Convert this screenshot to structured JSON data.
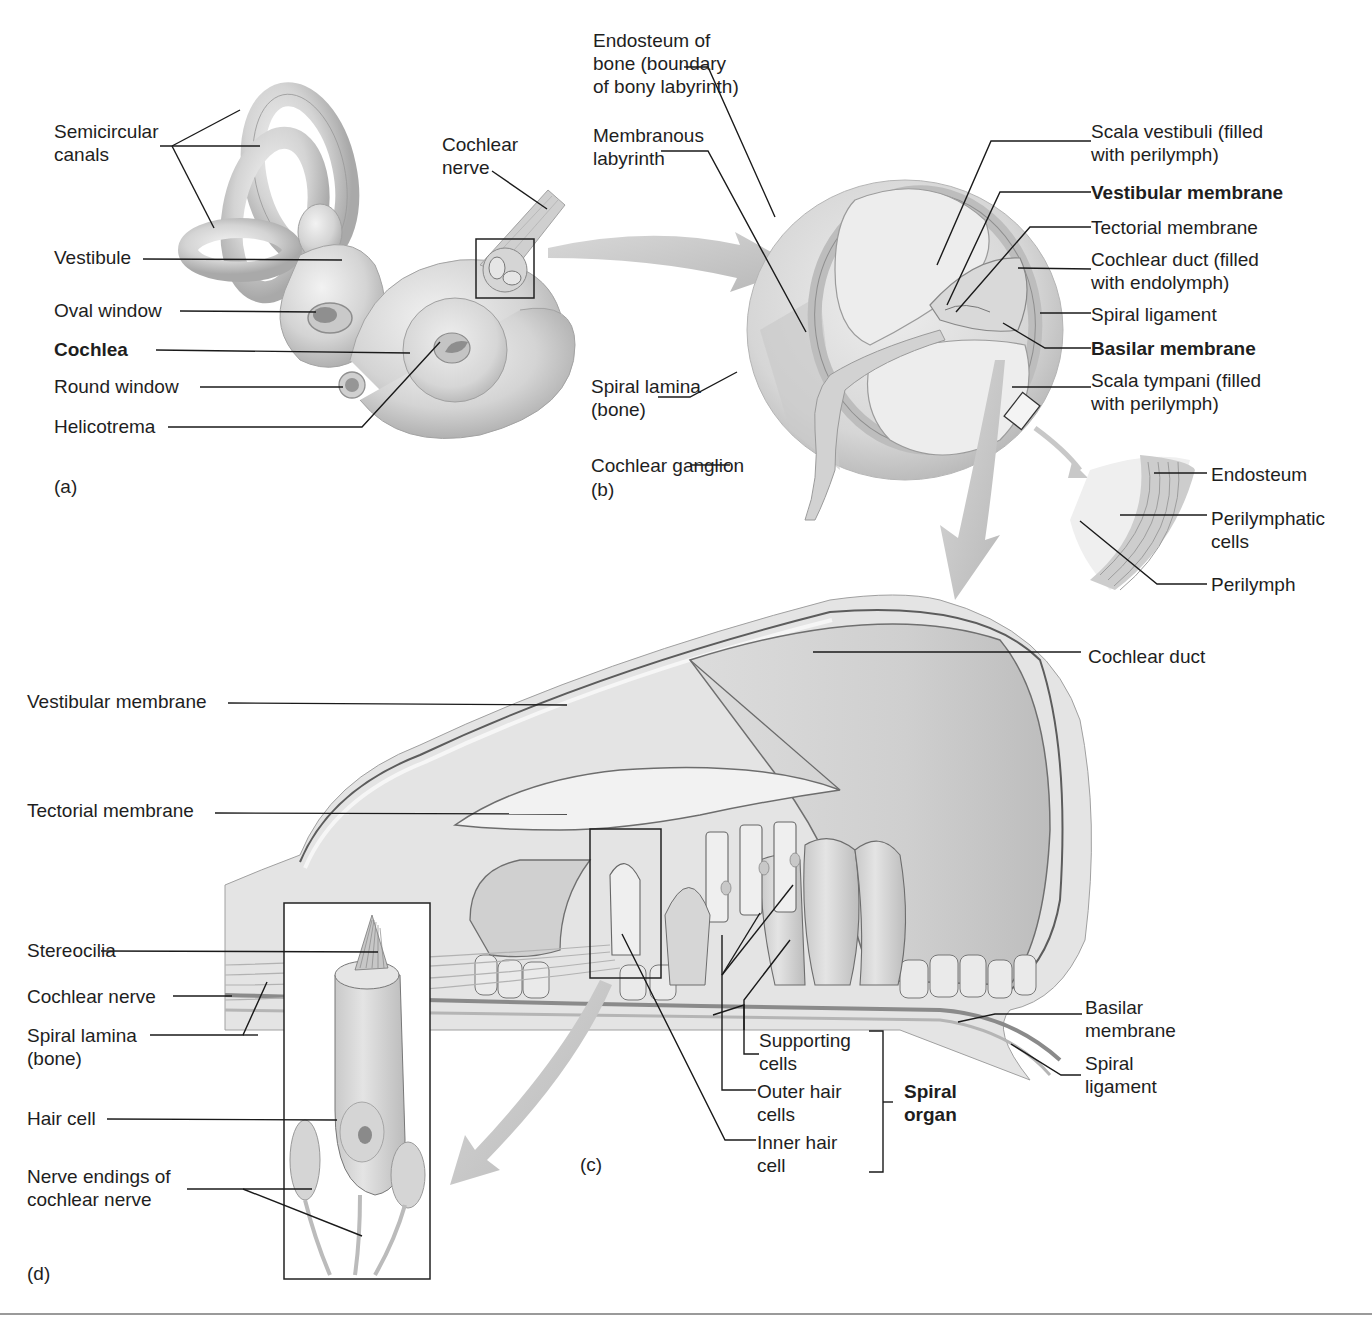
{
  "figure": {
    "panels": {
      "a": {
        "letter": "(a)",
        "labels": {
          "semicircular_canals": "Semicircular\ncanals",
          "vestibule": "Vestibule",
          "oval_window": "Oval window",
          "cochlea": "Cochlea",
          "round_window": "Round window",
          "helicotrema": "Helicotrema",
          "cochlear_nerve": "Cochlear\nnerve"
        }
      },
      "b": {
        "letter": "(b)",
        "labels": {
          "endosteum_of_bone": "Endosteum of\nbone (boundary\nof bony labyrinth)",
          "membranous_labyrinth": "Membranous\nlabyrinth",
          "scala_vestibuli": "Scala vestibuli (filled\nwith perilymph)",
          "vestibular_membrane": "Vestibular membrane",
          "tectorial_membrane": "Tectorial membrane",
          "cochlear_duct": "Cochlear duct (filled\nwith endolymph)",
          "spiral_ligament": "Spiral ligament",
          "basilar_membrane": "Basilar membrane",
          "scala_tympani": "Scala tympani (filled\nwith perilymph)",
          "spiral_lamina": "Spiral lamina\n(bone)",
          "cochlear_ganglion": "Cochlear ganglion"
        },
        "inset_labels": {
          "endosteum": "Endosteum",
          "perilymphatic_cells": "Perilymphatic\ncells",
          "perilymph": "Perilymph"
        }
      },
      "c": {
        "letter": "(c)",
        "labels": {
          "cochlear_duct": "Cochlear duct",
          "vestibular_membrane": "Vestibular membrane",
          "tectorial_membrane": "Tectorial membrane",
          "basilar_membrane": "Basilar\nmembrane",
          "spiral_ligament": "Spiral\nligament",
          "supporting_cells": "Supporting\ncells",
          "outer_hair_cells": "Outer hair\ncells",
          "inner_hair_cell": "Inner hair\ncell",
          "spiral_organ": "Spiral\norgan"
        }
      },
      "d": {
        "letter": "(d)",
        "labels": {
          "stereocilia": "Stereocilia",
          "cochlear_nerve": "Cochlear nerve",
          "spiral_lamina": "Spiral lamina\n(bone)",
          "hair_cell": "Hair cell",
          "nerve_endings": "Nerve endings of\ncochlear nerve"
        }
      }
    },
    "colors": {
      "tissue_light": "#e6e6e6",
      "tissue_mid": "#cfcfcf",
      "tissue_dark": "#a8a8a8",
      "leader_line": "#1a1a1a",
      "arrow": "#c4c4c4"
    }
  }
}
